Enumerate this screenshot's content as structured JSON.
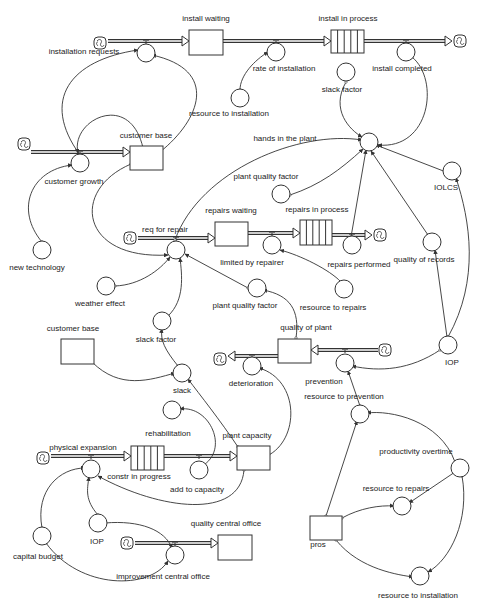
{
  "diagram": {
    "stroke_color": "#333333",
    "background": "#ffffff",
    "stocks": [
      {
        "id": "install_waiting",
        "label": "install waiting",
        "x": 189,
        "y": 30,
        "w": 34,
        "h": 25,
        "type": "stock",
        "lx": 206,
        "ly": 19
      },
      {
        "id": "install_in_process",
        "label": "install in process",
        "x": 331,
        "y": 30,
        "w": 33,
        "h": 23,
        "type": "conveyor",
        "lx": 348,
        "ly": 19
      },
      {
        "id": "customer_base",
        "label": "customer base",
        "x": 130,
        "y": 146,
        "w": 33,
        "h": 24,
        "type": "stock",
        "lx": 146,
        "ly": 136
      },
      {
        "id": "repairs_waiting",
        "label": "repairs waiting",
        "x": 215,
        "y": 222,
        "w": 33,
        "h": 24,
        "type": "stock",
        "lx": 231,
        "ly": 211
      },
      {
        "id": "repairs_in_process",
        "label": "repairs in process",
        "x": 300,
        "y": 220,
        "w": 32,
        "h": 25,
        "type": "conveyor",
        "lx": 317,
        "ly": 210
      },
      {
        "id": "customer_base_2",
        "label": "customer base",
        "x": 61,
        "y": 339,
        "w": 33,
        "h": 25,
        "type": "stock",
        "lx": 73,
        "ly": 329
      },
      {
        "id": "quality_of_plant",
        "label": "quality of plant",
        "x": 278,
        "y": 339,
        "w": 33,
        "h": 24,
        "type": "stock",
        "lx": 306,
        "ly": 328
      },
      {
        "id": "constr_in_progress",
        "label": "constr in progress",
        "x": 131,
        "y": 446,
        "w": 33,
        "h": 24,
        "type": "conveyor",
        "lx": 139,
        "ly": 477
      },
      {
        "id": "plant_capacity",
        "label": "plant capacity",
        "x": 237,
        "y": 446,
        "w": 33,
        "h": 24,
        "type": "stock",
        "lx": 247,
        "ly": 436
      },
      {
        "id": "quality_central_office",
        "label": "quality central office",
        "x": 218,
        "y": 535,
        "w": 34,
        "h": 25,
        "type": "stock",
        "lx": 226,
        "ly": 524
      },
      {
        "id": "pros",
        "label": "pros",
        "x": 310,
        "y": 516,
        "w": 32,
        "h": 24,
        "type": "stock",
        "lx": 318,
        "ly": 545
      }
    ],
    "converters": [
      {
        "id": "installation_requests_flow",
        "label": "installation requests",
        "x": 146,
        "y": 53,
        "lx": 84,
        "ly": 52
      },
      {
        "id": "rate_of_installation",
        "label": "rate of installation",
        "x": 276,
        "y": 52,
        "lx": 284,
        "ly": 69
      },
      {
        "id": "install_completed",
        "label": "install completed",
        "x": 406,
        "y": 52,
        "lx": 402,
        "ly": 69
      },
      {
        "id": "resource_to_installation_top",
        "label": "resource to installation",
        "x": 240,
        "y": 98,
        "lx": 229,
        "ly": 114
      },
      {
        "id": "slack_factor_top",
        "label": "slack factor",
        "x": 346,
        "y": 72,
        "lx": 342,
        "ly": 90
      },
      {
        "id": "hands_in_the_plant",
        "label": "hands in the plant",
        "x": 369,
        "y": 142,
        "lx": 285,
        "ly": 139
      },
      {
        "id": "customer_growth",
        "label": "customer growth",
        "x": 80,
        "y": 163,
        "lx": 74,
        "ly": 182
      },
      {
        "id": "plant_quality_factor_top",
        "label": "plant quality factor",
        "x": 281,
        "y": 194,
        "lx": 266,
        "ly": 177
      },
      {
        "id": "IOLCS",
        "label": "IOLCS",
        "x": 452,
        "y": 171,
        "lx": 446,
        "ly": 188
      },
      {
        "id": "new_technology",
        "label": "new technology",
        "x": 42,
        "y": 250,
        "lx": 37,
        "ly": 268
      },
      {
        "id": "req_for_repair",
        "label": "req for repair",
        "x": 176,
        "y": 250,
        "lx": 165,
        "ly": 230
      },
      {
        "id": "limited_by_repairer",
        "label": "limited by repairer",
        "x": 272,
        "y": 245,
        "lx": 252,
        "ly": 263
      },
      {
        "id": "repairs_performed",
        "label": "repairs performed",
        "x": 352,
        "y": 245,
        "lx": 359,
        "ly": 265
      },
      {
        "id": "quality_of_records",
        "label": "quality of records",
        "x": 432,
        "y": 242,
        "lx": 424,
        "ly": 260
      },
      {
        "id": "weather_effect",
        "label": "weather effect",
        "x": 106,
        "y": 286,
        "lx": 100,
        "ly": 304
      },
      {
        "id": "plant_quality_factor_mid",
        "label": "plant quality factor",
        "x": 257,
        "y": 288,
        "lx": 245,
        "ly": 306
      },
      {
        "id": "resource_to_repairs_top",
        "label": "resource to repairs",
        "x": 344,
        "y": 289,
        "lx": 333,
        "ly": 308
      },
      {
        "id": "slack_factor_mid",
        "label": "slack factor",
        "x": 162,
        "y": 321,
        "lx": 156,
        "ly": 340
      },
      {
        "id": "IOP_right",
        "label": "IOP",
        "x": 448,
        "y": 345,
        "lx": 452,
        "ly": 363
      },
      {
        "id": "deterioration",
        "label": "deterioration",
        "x": 252,
        "y": 366,
        "lx": 251,
        "ly": 384
      },
      {
        "id": "prevention",
        "label": "prevention",
        "x": 345,
        "y": 363,
        "lx": 324,
        "ly": 382
      },
      {
        "id": "slack",
        "label": "slack",
        "x": 182,
        "y": 373,
        "lx": 182,
        "ly": 391
      },
      {
        "id": "resource_to_prevention",
        "label": "resource to prevention",
        "x": 360,
        "y": 414,
        "lx": 344,
        "ly": 397
      },
      {
        "id": "rehabilitation",
        "label": "rehabilitation",
        "x": 172,
        "y": 410,
        "lx": 168,
        "ly": 434
      },
      {
        "id": "productivity_overtime",
        "label": "productivity overtime",
        "x": 460,
        "y": 468,
        "lx": 416,
        "ly": 452
      },
      {
        "id": "physical_expansion",
        "label": "physical expansion",
        "x": 91,
        "y": 469,
        "lx": 83,
        "ly": 448
      },
      {
        "id": "add_to_capacity",
        "label": "add to capacity",
        "x": 199,
        "y": 470,
        "lx": 197,
        "ly": 490
      },
      {
        "id": "resource_to_repairs_bottom",
        "label": "resource to repairs",
        "x": 402,
        "y": 506,
        "lx": 396,
        "ly": 489
      },
      {
        "id": "IOP_bottom",
        "label": "IOP",
        "x": 98,
        "y": 523,
        "lx": 97,
        "ly": 542
      },
      {
        "id": "capital_budget",
        "label": "capital budget",
        "x": 42,
        "y": 536,
        "lx": 38,
        "ly": 557
      },
      {
        "id": "improvement_central_office",
        "label": "improvement central office",
        "x": 175,
        "y": 555,
        "lx": 163,
        "ly": 577
      },
      {
        "id": "resource_to_installation_bottom",
        "label": "resource to installation",
        "x": 420,
        "y": 576,
        "lx": 418,
        "ly": 596
      }
    ],
    "clouds": [
      {
        "id": "cloud_install_src",
        "x": 100,
        "y": 43
      },
      {
        "id": "cloud_install_sink",
        "x": 460,
        "y": 41
      },
      {
        "id": "cloud_customer_src",
        "x": 24,
        "y": 144
      },
      {
        "id": "cloud_repair_src",
        "x": 130,
        "y": 238
      },
      {
        "id": "cloud_repair_sink",
        "x": 380,
        "y": 235
      },
      {
        "id": "cloud_quality_sink",
        "x": 220,
        "y": 359
      },
      {
        "id": "cloud_quality_src",
        "x": 385,
        "y": 350
      },
      {
        "id": "cloud_expansion_src",
        "x": 43,
        "y": 458
      },
      {
        "id": "cloud_central_office_src",
        "x": 127,
        "y": 543
      }
    ],
    "flows": [
      {
        "id": "f_install_requests",
        "points": [
          [
            108,
            41
          ],
          [
            189,
            41
          ]
        ]
      },
      {
        "id": "f_rate_of_installation",
        "points": [
          [
            223,
            41
          ],
          [
            331,
            41
          ]
        ]
      },
      {
        "id": "f_install_completed",
        "points": [
          [
            364,
            41
          ],
          [
            452,
            41
          ]
        ]
      },
      {
        "id": "f_customer_growth",
        "points": [
          [
            31,
            152
          ],
          [
            130,
            152
          ]
        ]
      },
      {
        "id": "f_req_for_repair",
        "points": [
          [
            138,
            238
          ],
          [
            215,
            238
          ]
        ]
      },
      {
        "id": "f_limited_by_repairer",
        "points": [
          [
            248,
            233
          ],
          [
            300,
            233
          ]
        ]
      },
      {
        "id": "f_repairs_performed",
        "points": [
          [
            332,
            235
          ],
          [
            372,
            235
          ]
        ]
      },
      {
        "id": "f_deterioration",
        "points": [
          [
            278,
            356
          ],
          [
            228,
            356
          ]
        ]
      },
      {
        "id": "f_prevention",
        "points": [
          [
            378,
            350
          ],
          [
            311,
            350
          ]
        ]
      },
      {
        "id": "f_physical_expansion",
        "points": [
          [
            51,
            456
          ],
          [
            131,
            456
          ]
        ]
      },
      {
        "id": "f_add_to_capacity",
        "points": [
          [
            164,
            456
          ],
          [
            237,
            456
          ]
        ]
      },
      {
        "id": "f_improvement_central_office",
        "points": [
          [
            135,
            543
          ],
          [
            218,
            543
          ]
        ]
      }
    ],
    "connectors": [
      {
        "d": "M143,148 C130,90 70,120 78,153"
      },
      {
        "d": "M160,152 C200,120 220,70 152,55"
      },
      {
        "d": "M80,155 C40,100 70,60 138,50"
      },
      {
        "d": "M240,90 C240,75 255,60 268,52"
      },
      {
        "d": "M346,82 C330,110 350,130 362,137"
      },
      {
        "d": "M412,57 C440,80 430,150 378,145"
      },
      {
        "d": "M131,164 C70,190 80,260 168,255"
      },
      {
        "d": "M290,195 C320,185 340,170 363,149"
      },
      {
        "d": "M446,172 L376,145"
      },
      {
        "d": "M351,237 L366,150"
      },
      {
        "d": "M428,235 L371,151"
      },
      {
        "d": "M42,242 C15,210 30,170 72,165"
      },
      {
        "d": "M175,240 C200,170 300,130 362,140"
      },
      {
        "d": "M115,286 C140,285 160,270 170,257"
      },
      {
        "d": "M248,288 L185,254"
      },
      {
        "d": "M168,316 C185,300 182,275 180,258"
      },
      {
        "d": "M296,338 C300,310 290,295 263,290"
      },
      {
        "d": "M341,282 C330,270 300,255 280,250"
      },
      {
        "d": "M92,362 C120,390 150,380 175,373"
      },
      {
        "d": "M178,366 C165,350 160,340 162,329"
      },
      {
        "d": "M448,337 C480,280 470,220 456,178"
      },
      {
        "d": "M447,337 L435,250"
      },
      {
        "d": "M440,350 C410,370 380,372 352,366"
      },
      {
        "d": "M238,447 C220,420 200,395 188,379"
      },
      {
        "d": "M267,456 C300,440 300,380 259,368"
      },
      {
        "d": "M202,466 C230,450 210,405 180,409"
      },
      {
        "d": "M360,406 L348,371"
      },
      {
        "d": "M455,462 C440,420 390,410 367,413"
      },
      {
        "d": "M455,472 L409,503"
      },
      {
        "d": "M462,476 C470,520 450,560 428,572"
      },
      {
        "d": "M326,516 L357,421"
      },
      {
        "d": "M342,518 C360,508 380,505 394,506"
      },
      {
        "d": "M336,540 C360,570 400,575 413,577"
      },
      {
        "d": "M244,470 C240,520 160,510 98,476"
      },
      {
        "d": "M98,515 C85,500 87,490 89,477"
      },
      {
        "d": "M42,528 C35,490 60,468 85,468"
      },
      {
        "d": "M105,523 C140,520 165,530 172,548"
      },
      {
        "d": "M46,543 C80,590 150,590 168,561"
      }
    ]
  }
}
